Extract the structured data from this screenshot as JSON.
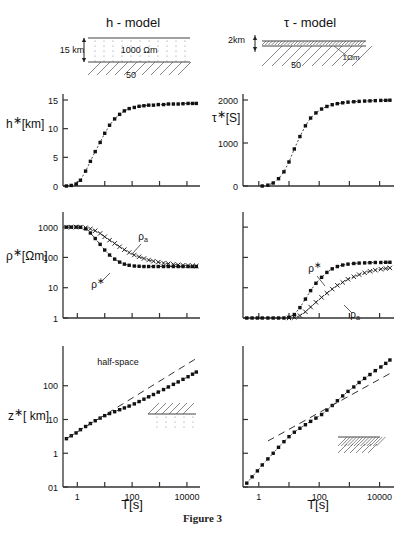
{
  "figure": {
    "caption": "Figure 3",
    "models": [
      {
        "title": "h - model",
        "depth_label": "15 km",
        "layer_label": "1000 Ωm",
        "halfspace_label": "50"
      },
      {
        "title": "τ - model",
        "depth_label": "2km",
        "layer_label": "1Ωm",
        "halfspace_label": "50"
      }
    ],
    "axis_x_label": "T[s]",
    "xticks": [
      "1",
      "100",
      "10000"
    ],
    "annotations": {
      "halfspace": "half-space",
      "rho_star": "ρ",
      "rho_a": "ρ",
      "rho_a_sub": "a"
    }
  },
  "chart_data": [
    {
      "id": "h-star-vs-T",
      "type": "line",
      "title": "",
      "xlabel": "T[s]",
      "ylabel": "h*[km]",
      "xscale": "log",
      "yscale": "linear",
      "xlim": [
        0.3,
        30000
      ],
      "ylim": [
        0,
        15
      ],
      "yticks": [
        0,
        5,
        10,
        15
      ],
      "ytick_labels": [
        "0",
        "5",
        "10",
        "15"
      ],
      "xticks": [
        1,
        10,
        100,
        1000,
        10000
      ],
      "xtick_labels": [
        "1",
        "",
        "100",
        "",
        "10000"
      ],
      "grid": false,
      "legend": "none",
      "series": [
        {
          "name": "h*",
          "style": "dashed-with-filled-squares",
          "x": [
            0.4,
            0.6,
            0.9,
            1.3,
            2.0,
            3.0,
            4.5,
            6.8,
            10,
            15,
            23,
            35,
            52,
            78,
            120,
            180,
            270,
            400,
            600,
            900,
            1400,
            2100,
            3200,
            4800,
            7200,
            11000,
            16000,
            22000
          ],
          "y": [
            0.0,
            0.1,
            0.35,
            1.0,
            2.6,
            4.3,
            6.0,
            7.6,
            9.2,
            10.6,
            11.7,
            12.5,
            13.1,
            13.5,
            13.7,
            13.9,
            14.0,
            14.1,
            14.1,
            14.2,
            14.2,
            14.3,
            14.3,
            14.3,
            14.35,
            14.4,
            14.4,
            14.4
          ]
        }
      ]
    },
    {
      "id": "tau-star-vs-T",
      "type": "line",
      "title": "",
      "xlabel": "T[s]",
      "ylabel": "τ*[S]",
      "xscale": "log",
      "yscale": "linear",
      "xlim": [
        0.3,
        30000
      ],
      "ylim": [
        0,
        2000
      ],
      "yticks": [
        0,
        1000,
        2000
      ],
      "ytick_labels": [
        "0",
        "1000",
        "2000"
      ],
      "xticks": [
        1,
        10,
        100,
        1000,
        10000
      ],
      "xtick_labels": [
        "1",
        "",
        "100",
        "",
        "10000"
      ],
      "grid": false,
      "legend": "none",
      "series": [
        {
          "name": "τ*",
          "style": "dashed-with-filled-squares",
          "x": [
            1.3,
            2.0,
            3.0,
            4.5,
            6.8,
            10,
            15,
            23,
            35,
            52,
            78,
            120,
            180,
            270,
            400,
            600,
            900,
            1400,
            2100,
            3200,
            4800,
            7200,
            11000,
            16000,
            22000
          ],
          "y": [
            0,
            20,
            70,
            170,
            330,
            560,
            860,
            1150,
            1400,
            1580,
            1700,
            1790,
            1850,
            1890,
            1915,
            1935,
            1950,
            1960,
            1968,
            1975,
            1980,
            1985,
            1990,
            1992,
            1995
          ]
        }
      ]
    },
    {
      "id": "rho-star-h-model",
      "type": "line",
      "title": "",
      "xlabel": "T[s]",
      "ylabel": "ρ*[Ωm]",
      "xscale": "log",
      "yscale": "log",
      "xlim": [
        0.3,
        30000
      ],
      "ylim": [
        1,
        2000
      ],
      "yticks": [
        1,
        10,
        100,
        1000
      ],
      "ytick_labels": [
        "1",
        "10",
        "100",
        "1000"
      ],
      "xticks": [
        1,
        10,
        100,
        1000,
        10000
      ],
      "xtick_labels": [
        "1",
        "",
        "100",
        "",
        "10000"
      ],
      "grid": false,
      "legend": "inline-labels",
      "series": [
        {
          "name": "ρ*",
          "label": "ρ",
          "style": "dashdot-with-filled-squares",
          "x": [
            0.4,
            0.6,
            0.9,
            1.3,
            2.0,
            3.0,
            4.5,
            6.8,
            10,
            15,
            23,
            35,
            52,
            78,
            120,
            180,
            270,
            400,
            600,
            900,
            1400,
            2100,
            3200,
            4800,
            7200,
            11000,
            16000,
            22000
          ],
          "y": [
            1000,
            1000,
            1000,
            990,
            880,
            640,
            420,
            270,
            175,
            120,
            88,
            70,
            60,
            55,
            52,
            51,
            50,
            50,
            50,
            50,
            50,
            50,
            50,
            50,
            50,
            50,
            50,
            50
          ]
        },
        {
          "name": "ρa",
          "label": "ρa",
          "style": "dashdot-with-crosses",
          "x": [
            0.4,
            0.6,
            0.9,
            1.3,
            2.0,
            3.0,
            4.5,
            6.8,
            10,
            15,
            23,
            35,
            52,
            78,
            120,
            180,
            270,
            400,
            600,
            900,
            1400,
            2100,
            3200,
            4800,
            7200,
            11000,
            16000,
            22000
          ],
          "y": [
            1000,
            1000,
            1010,
            1000,
            960,
            880,
            760,
            620,
            480,
            370,
            290,
            225,
            180,
            145,
            120,
            105,
            92,
            82,
            75,
            70,
            65,
            62,
            59,
            57,
            55,
            54,
            53,
            52
          ]
        }
      ]
    },
    {
      "id": "rho-star-tau-model",
      "type": "line",
      "title": "",
      "xlabel": "T[s]",
      "ylabel": "",
      "xscale": "log",
      "yscale": "log",
      "xlim": [
        0.3,
        30000
      ],
      "ylim": [
        1,
        2000
      ],
      "yticks": [
        1,
        10,
        100,
        1000
      ],
      "ytick_labels": [
        "",
        "",
        "",
        ""
      ],
      "xticks": [
        1,
        10,
        100,
        1000,
        10000
      ],
      "xtick_labels": [
        "1",
        "",
        "100",
        "",
        "10000"
      ],
      "grid": false,
      "legend": "inline-labels",
      "series": [
        {
          "name": "ρ*",
          "label": "ρ",
          "style": "dashed-with-filled-squares",
          "x": [
            0.4,
            0.6,
            0.9,
            1.3,
            2.0,
            3.0,
            4.5,
            6.8,
            10,
            15,
            23,
            35,
            52,
            78,
            120,
            180,
            270,
            400,
            600,
            900,
            1400,
            2100,
            3200,
            4800,
            7200,
            11000,
            16000,
            22000
          ],
          "y": [
            1.0,
            1.0,
            1.0,
            1.0,
            1.0,
            1.0,
            1.0,
            1.0,
            1.05,
            1.3,
            2.2,
            4.2,
            8.0,
            14,
            22,
            32,
            42,
            50,
            56,
            60,
            63,
            65,
            66,
            67,
            68,
            68,
            69,
            69
          ]
        },
        {
          "name": "ρa",
          "label": "ρa",
          "style": "dashed-with-crosses",
          "x": [
            10,
            15,
            23,
            35,
            52,
            78,
            120,
            180,
            270,
            400,
            600,
            900,
            1400,
            2100,
            3200,
            4800,
            7200,
            11000,
            16000,
            22000
          ],
          "y": [
            1.0,
            1.05,
            1.2,
            1.6,
            2.3,
            3.3,
            4.8,
            6.6,
            9.0,
            12,
            15,
            19,
            23,
            27,
            31,
            35,
            38,
            41,
            43,
            45
          ]
        }
      ]
    },
    {
      "id": "z-star-h-model",
      "type": "line",
      "title": "",
      "xlabel": "T[s]",
      "ylabel": "z*[ km]",
      "xscale": "log",
      "yscale": "log",
      "xlim": [
        0.3,
        30000
      ],
      "ylim": [
        0.1,
        1000
      ],
      "yticks": [
        0.1,
        1,
        10,
        100
      ],
      "ytick_labels": [
        "01",
        "1",
        "10",
        "100"
      ],
      "xticks": [
        1,
        10,
        100,
        1000,
        10000
      ],
      "xtick_labels": [
        "1",
        "",
        "100",
        "",
        "10000"
      ],
      "grid": false,
      "legend": "inline-labels",
      "annotation": "half-space",
      "series": [
        {
          "name": "z*",
          "style": "dotted-with-filled-squares",
          "x": [
            0.4,
            0.6,
            0.9,
            1.3,
            2.0,
            3.0,
            4.5,
            6.8,
            10,
            15,
            23,
            35,
            52,
            78,
            120,
            180,
            270,
            400,
            600,
            900,
            1400,
            2100,
            3200,
            4800,
            7200,
            11000,
            16000,
            22000
          ],
          "y": [
            2.7,
            3.3,
            4.0,
            5.0,
            6.2,
            7.6,
            9.2,
            11.0,
            13.0,
            15.0,
            17.0,
            19.5,
            22,
            25,
            29,
            34,
            40,
            47,
            55,
            65,
            77,
            92,
            110,
            130,
            155,
            185,
            220,
            255
          ]
        },
        {
          "name": "half-space",
          "style": "long-dashed-line",
          "x": [
            0.4,
            22000
          ],
          "y": [
            2.7,
            640
          ]
        }
      ]
    },
    {
      "id": "z-star-tau-model",
      "type": "line",
      "title": "",
      "xlabel": "T[s]",
      "ylabel": "",
      "xscale": "log",
      "yscale": "log",
      "xlim": [
        0.3,
        30000
      ],
      "ylim": [
        0.1,
        1000
      ],
      "yticks": [
        0.1,
        1,
        10,
        100
      ],
      "ytick_labels": [
        "",
        "",
        "",
        ""
      ],
      "xticks": [
        1,
        10,
        100,
        1000,
        10000
      ],
      "xtick_labels": [
        "1",
        "",
        "100",
        "",
        "10000"
      ],
      "grid": false,
      "legend": "none",
      "series": [
        {
          "name": "z*",
          "style": "dotted-with-filled-squares",
          "x": [
            0.4,
            0.6,
            0.9,
            1.3,
            2.0,
            3.0,
            4.5,
            6.8,
            10,
            15,
            23,
            35,
            52,
            78,
            120,
            180,
            270,
            400,
            600,
            900,
            1400,
            2100,
            3200,
            4800,
            7200,
            11000,
            16000,
            22000
          ],
          "y": [
            0.13,
            0.2,
            0.3,
            0.45,
            0.68,
            1.0,
            1.5,
            2.2,
            3.1,
            4.2,
            5.5,
            7.0,
            8.8,
            11,
            14,
            19,
            26,
            36,
            50,
            68,
            92,
            125,
            165,
            215,
            280,
            360,
            460,
            580
          ]
        },
        {
          "name": "half-space",
          "style": "long-dashed-line",
          "x": [
            2.0,
            22000
          ],
          "y": [
            2.3,
            230
          ]
        }
      ]
    }
  ]
}
